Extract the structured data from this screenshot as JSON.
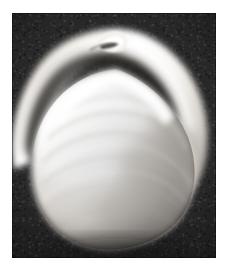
{
  "image": {
    "kind": "photograph",
    "medium": "black-and-white photographic plate",
    "subject": "bivalve clam shell (single valve, exterior view)",
    "caption": "Black and white photograph of a clam shell on a dark background",
    "orientation": "umbo (beak) uppermost, ventral margin lowermost",
    "width_px": 232,
    "height_px": 274
  },
  "canvas": {
    "background_color": "#ffffff",
    "margin_left_px": 12,
    "margin_top_px": 13,
    "margin_right_px": 16,
    "margin_bottom_px": 16
  },
  "plate": {
    "name": "photo-plate",
    "left_px": 12,
    "top_px": 13,
    "width_px": 204,
    "height_px": 245,
    "background_color": "#232323",
    "background_shade_dark": "#161616",
    "background_shade_light": "#2e2e2e",
    "grain": "visible film grain / mottled texture"
  },
  "specimen": {
    "name": "clam-shell",
    "highlight_color": "#ffffff",
    "midtone_color": "#e6e3df",
    "shadow_color": "#a9a39c",
    "groove_color": "#3a3732",
    "bounds": {
      "left_px": 33,
      "right_px": 199,
      "top_px": 31,
      "bottom_px": 241
    },
    "parts": [
      {
        "name": "umbo-beak",
        "label": "Umbo (beak)",
        "position": "top center, apex near x=104 y=32"
      },
      {
        "name": "outer-rim-arc",
        "label": "Outer shell rim",
        "position": "broad bright arc sweeping from lower-left up over the beak and down to the right"
      },
      {
        "name": "shadow-groove",
        "label": "Shadowed groove",
        "position": "dark band separating outer rim from inner body"
      },
      {
        "name": "inner-body",
        "label": "Inner shell body",
        "position": "large bright dome filling lower two-thirds"
      },
      {
        "name": "growth-rings",
        "label": "Concentric growth rings",
        "position": "faint curved bands across the inner body"
      },
      {
        "name": "ventral-margin",
        "label": "Ventral margin",
        "position": "rounded bottom edge near y=240"
      }
    ]
  }
}
